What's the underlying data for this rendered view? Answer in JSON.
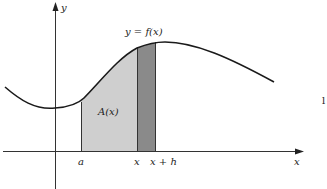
{
  "figure": {
    "labels": {
      "y_axis": "y",
      "x_axis": "x",
      "curve": "y = f(x)",
      "area": "A(x)",
      "tick_a": "a",
      "tick_x": "x",
      "tick_x_plus_h": "x + h",
      "margin_mark": "l"
    },
    "colors": {
      "curve": "#1a1a1a",
      "axes": "#333333",
      "area_fill": "#cfcfcf",
      "strip_fill": "#8a8a8a",
      "background": "#ffffff"
    },
    "elements": {
      "region_area": "A(x) shaded from a to x",
      "region_strip": "strip from x to x + h"
    }
  }
}
